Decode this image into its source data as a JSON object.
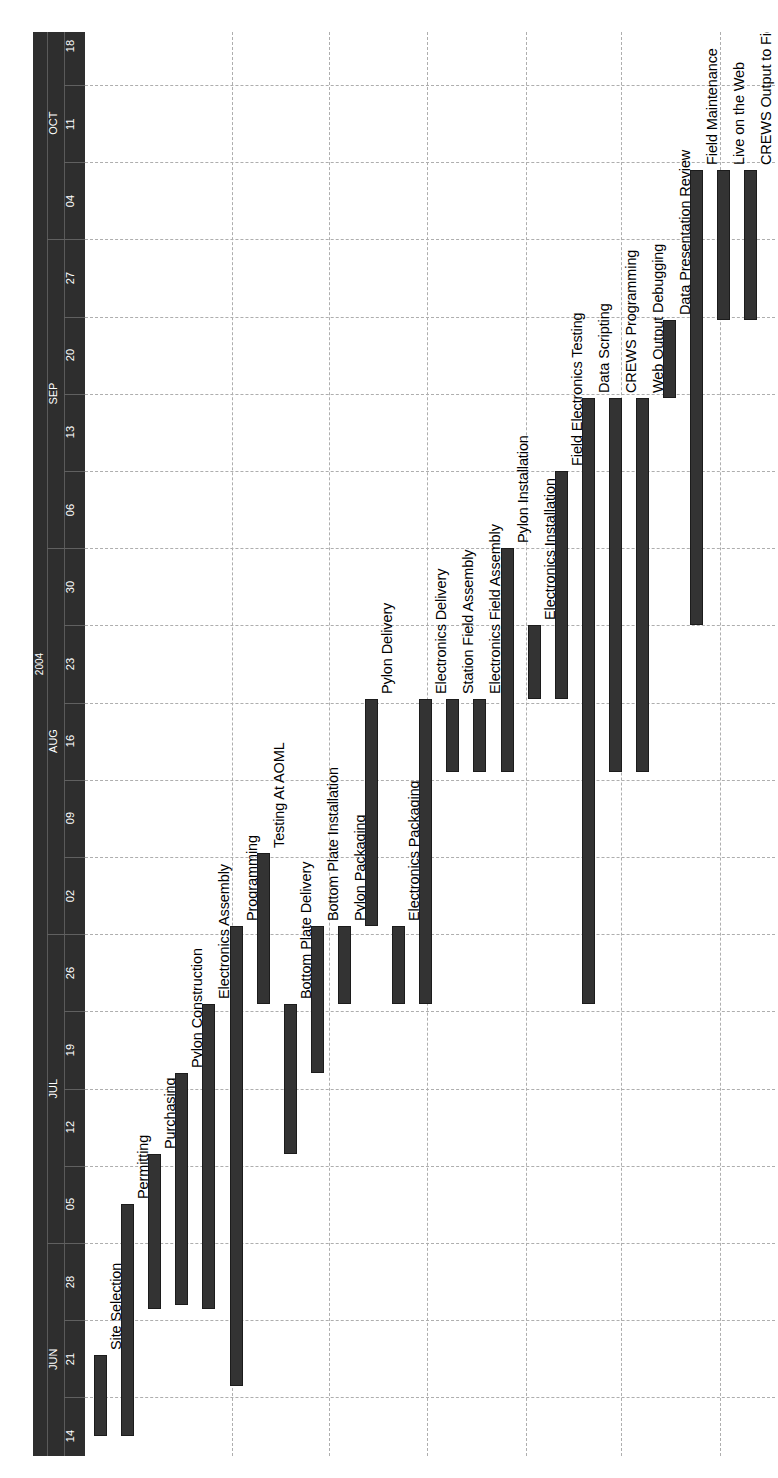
{
  "chart_data": {
    "type": "bar",
    "subtype": "gantt",
    "title": "",
    "orientation": "rotated-90ccw",
    "year": "2004",
    "xlabel": "",
    "ylabel": "",
    "time_axis": {
      "label": "2004",
      "months": [
        {
          "name": "JUN",
          "weeks": [
            "14",
            "21",
            "28"
          ]
        },
        {
          "name": "JUL",
          "weeks": [
            "05",
            "12",
            "19",
            "26"
          ]
        },
        {
          "name": "AUG",
          "weeks": [
            "02",
            "09",
            "16",
            "23",
            "30"
          ]
        },
        {
          "name": "SEP",
          "weeks": [
            "06",
            "13",
            "20",
            "27"
          ]
        },
        {
          "name": "OCT",
          "weeks": [
            "04",
            "11",
            "18"
          ]
        }
      ],
      "tick_labels": [
        "14",
        "21",
        "28",
        "05",
        "12",
        "19",
        "26",
        "02",
        "09",
        "16",
        "23",
        "30",
        "06",
        "13",
        "20",
        "27",
        "04",
        "11",
        "18"
      ],
      "range_start": "2004-06-14",
      "range_end": "2004-10-18",
      "week_step_days": 7
    },
    "grid": {
      "time_grid": true,
      "task_grid": true,
      "style": "dashed"
    },
    "colors": {
      "bar": "#333333",
      "bar_border": "#1c1c1c",
      "header_band": "#2e2e2e",
      "header_text": "#ffffff",
      "grid": "#aeaeae",
      "frame": "#3a3a3a",
      "background": "#ffffff"
    },
    "categories": [
      "Site Selection",
      "Permitting",
      "Purchasing",
      "Pylon Construction",
      "Electronics Assembly",
      "Programming",
      "Testing At AOML",
      "Bottom Plate Delivery",
      "Bottom Plate Installation",
      "Pylon Packaging",
      "Pylon Delivery",
      "Electronics Packaging",
      "Electronics Delivery",
      "Station Field Assembly",
      "Electronics Field Assembly",
      "Pylon Installation",
      "Electronics Installation",
      "Field Electronics Testing",
      "Data Scripting",
      "CREWS Programming",
      "Web Output Debugging",
      "Data Presentation Review",
      "Field Maintenance",
      "Live on the Web",
      "CREWS Output to Field"
    ],
    "tasks": [
      {
        "name": "Site Selection",
        "start_week": 0.0,
        "end_week": 1.05
      },
      {
        "name": "Permitting",
        "start_week": 0.0,
        "end_week": 3.0
      },
      {
        "name": "Purchasing",
        "start_week": 1.65,
        "end_week": 3.65
      },
      {
        "name": "Pylon Construction",
        "start_week": 1.7,
        "end_week": 4.7
      },
      {
        "name": "Electronics Assembly",
        "start_week": 1.65,
        "end_week": 5.6
      },
      {
        "name": "Programming",
        "start_week": 0.65,
        "end_week": 6.6
      },
      {
        "name": "Testing At AOML",
        "start_week": 5.6,
        "end_week": 7.55
      },
      {
        "name": "Bottom Plate Delivery",
        "start_week": 3.65,
        "end_week": 5.6
      },
      {
        "name": "Bottom Plate Installation",
        "start_week": 4.7,
        "end_week": 6.6
      },
      {
        "name": "Pylon Packaging",
        "start_week": 5.6,
        "end_week": 6.6
      },
      {
        "name": "Pylon Delivery",
        "start_week": 6.6,
        "end_week": 9.55
      },
      {
        "name": "Electronics Packaging",
        "start_week": 5.6,
        "end_week": 6.6
      },
      {
        "name": "Electronics Delivery",
        "start_week": 5.6,
        "end_week": 9.55
      },
      {
        "name": "Station Field Assembly",
        "start_week": 8.6,
        "end_week": 9.55
      },
      {
        "name": "Electronics Field Assembly",
        "start_week": 8.6,
        "end_week": 9.55
      },
      {
        "name": "Pylon Installation",
        "start_week": 8.6,
        "end_week": 11.5
      },
      {
        "name": "Electronics Installation",
        "start_week": 9.55,
        "end_week": 10.5
      },
      {
        "name": "Field Electronics Testing",
        "start_week": 9.55,
        "end_week": 12.5
      },
      {
        "name": "Data Scripting",
        "start_week": 5.6,
        "end_week": 13.45
      },
      {
        "name": "CREWS Programming",
        "start_week": 8.6,
        "end_week": 13.45
      },
      {
        "name": "Web Output Debugging",
        "start_week": 8.6,
        "end_week": 13.45
      },
      {
        "name": "Data Presentation Review",
        "start_week": 13.45,
        "end_week": 14.45
      },
      {
        "name": "Field Maintenance",
        "start_week": 10.5,
        "end_week": 16.4
      },
      {
        "name": "Live on the Web",
        "start_week": 14.45,
        "end_week": 16.4
      },
      {
        "name": "CREWS Output to Field",
        "start_week": 14.45,
        "end_week": 16.4
      }
    ]
  }
}
